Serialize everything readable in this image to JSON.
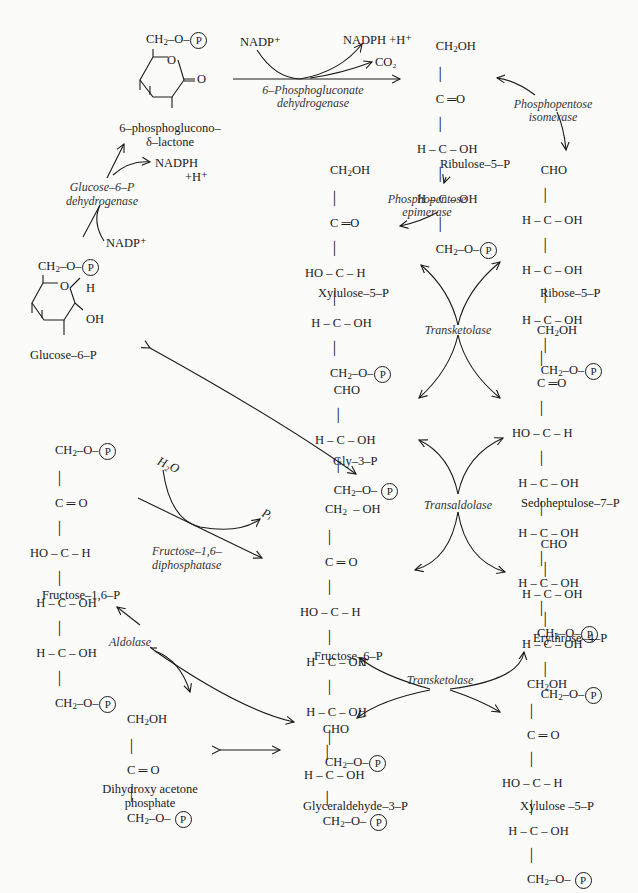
{
  "diagram": {
    "compounds": [
      {
        "id": "glucose-6-p",
        "label": "Glucose–6–P"
      },
      {
        "id": "lactone",
        "label": "6–phosphoglucono–",
        "label2": "δ–lactone"
      },
      {
        "id": "ribulose-5-p",
        "label": "Ribulose–5–P"
      },
      {
        "id": "xylulose-5-p-top",
        "label": "Xylulose–5–P"
      },
      {
        "id": "ribose-5-p",
        "label": "Ribose–5–P"
      },
      {
        "id": "gly-3-p",
        "label": "Gly–3–P"
      },
      {
        "id": "sedoheptulose-7-p",
        "label": "Sedoheptulose–7–P"
      },
      {
        "id": "fructose-1-6-p",
        "label": "Fructose–1,6–P"
      },
      {
        "id": "fructose-6-p",
        "label": "Fructose–6–P"
      },
      {
        "id": "erythrose-4-p",
        "label": "Erythrose–4–P"
      },
      {
        "id": "dhap",
        "label": "Dihydroxy acetone",
        "label2": "phosphate"
      },
      {
        "id": "glyceraldehyde-3-p",
        "label": "Glyceraldehyde–3–P"
      },
      {
        "id": "xylulose-5-p-bottom",
        "label": "Xylulose –5–P"
      }
    ],
    "enzymes": {
      "g6pdh": {
        "line1": "Glucose–6–P",
        "line2": "dehydrogenase"
      },
      "pgdh": {
        "line1": "6–Phosphogluconate",
        "line2": "dehydrogenase"
      },
      "isomerase": {
        "line1": "Phosphopentose",
        "line2": "isomerase"
      },
      "epimerase": {
        "line1": "Phosphopentose",
        "line2": "epimerase"
      },
      "transketolase1": "Transketolase",
      "transaldolase": "Transaldolase",
      "transketolase2": "Transketolase",
      "fbpase": {
        "line1": "Fructose–1,6–",
        "line2": "diphosphatase"
      },
      "aldolase": "Aldolase"
    },
    "cofactors": {
      "nadp_1": "NADP⁺",
      "nadph_1": "NADPH",
      "h_1": "+H⁺",
      "nadp_2": "NADP⁺",
      "nadph_2": "NADPH +H⁺",
      "co2": "CO₂",
      "h2o": "H₂O",
      "pi": "Pᵢ"
    },
    "phosphate_symbol": "P"
  }
}
